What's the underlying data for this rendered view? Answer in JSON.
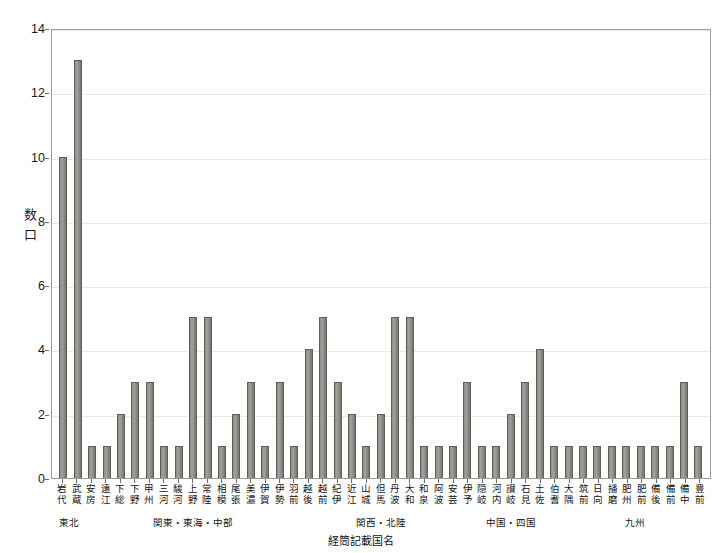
{
  "chart_data": {
    "type": "bar",
    "title": "",
    "xlabel": "経筒記載国名",
    "ylabel": "数口",
    "ylim": [
      0,
      14
    ],
    "yticks": [
      0,
      2,
      4,
      6,
      8,
      10,
      12,
      14
    ],
    "grid": true,
    "legend": "none",
    "categories": [
      "岩代",
      "武蔵",
      "安房",
      "遠江",
      "下総",
      "下野",
      "甲州",
      "三河",
      "駿河",
      "上野",
      "常陸",
      "相模",
      "尾張",
      "美濃",
      "伊賀",
      "伊勢",
      "羽前",
      "越後",
      "越前",
      "紀伊",
      "近江",
      "山城",
      "但馬",
      "丹波",
      "大和",
      "和泉",
      "阿波",
      "安芸",
      "伊予",
      "隠岐",
      "河内",
      "讃岐",
      "石見",
      "土佐",
      "伯耆",
      "大隅",
      "筑前",
      "日向",
      "播磨",
      "肥州",
      "肥前",
      "備後",
      "備前",
      "備中",
      "豊前"
    ],
    "values": [
      10,
      13,
      1,
      1,
      2,
      3,
      3,
      1,
      1,
      5,
      5,
      1,
      2,
      3,
      1,
      3,
      1,
      4,
      5,
      3,
      2,
      1,
      2,
      5,
      5,
      1,
      1,
      1,
      3,
      1,
      1,
      2,
      3,
      4,
      1,
      1,
      1,
      1,
      1,
      1,
      1,
      1,
      1,
      3,
      1
    ],
    "bar_color": "#8d8d87",
    "bar_edge_color": "#5f5f59",
    "axis_color": "#9a9a9a",
    "grid_color": "#e8e8e4",
    "region_groups": [
      {
        "label": "東北",
        "start": 0,
        "end": 1
      },
      {
        "label": "関東・東海・中部",
        "start": 2,
        "end": 16
      },
      {
        "label": "関西・北陸",
        "start": 17,
        "end": 27
      },
      {
        "label": "中国・四国",
        "start": 28,
        "end": 34
      },
      {
        "label": "九州",
        "start": 35,
        "end": 44
      }
    ]
  }
}
